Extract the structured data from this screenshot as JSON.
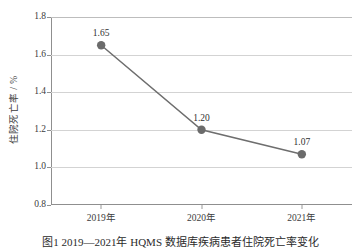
{
  "chart_data": {
    "type": "line",
    "title": "",
    "subtitle": "",
    "xlabel": "",
    "ylabel": "住院死亡率 / %",
    "categories": [
      "2019年",
      "2020年",
      "2021年"
    ],
    "values": [
      1.65,
      1.2,
      1.07
    ],
    "point_labels": [
      "1.65",
      "1.20",
      "1.07"
    ],
    "series": [
      {
        "name": "住院死亡率",
        "values": [
          1.65,
          1.2,
          1.07
        ]
      }
    ],
    "ylim": [
      0.8,
      1.8
    ],
    "ytick_labels": [
      "0.8",
      "1.0",
      "1.2",
      "1.4",
      "1.6",
      "1.8"
    ],
    "ytick_values": [
      0.8,
      1.0,
      1.2,
      1.4,
      1.6,
      1.8
    ],
    "grid": "horizontal",
    "legend": "none",
    "marker": "circle",
    "colors": {
      "line": "#6e6e6e",
      "marker": "#6b6b6b",
      "gridline": "#d3d3d3",
      "axis": "#8f8f8f",
      "text": "#3c3c3c",
      "background": "#ffffff"
    }
  },
  "caption": {
    "text": "图1 2019—2021年 HQMS 数据库疾病患者住院死亡率变化"
  }
}
